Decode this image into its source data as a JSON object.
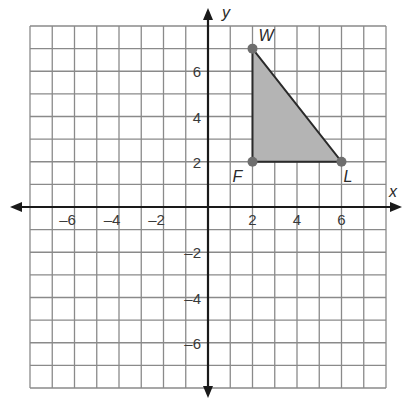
{
  "chart_data": {
    "type": "scatter",
    "title": "",
    "xlabel": "x",
    "ylabel": "y",
    "xlim": [
      -8,
      8
    ],
    "ylim": [
      -8,
      8
    ],
    "grid": true,
    "x_ticks": [
      -6,
      -4,
      -2,
      2,
      4,
      6
    ],
    "y_ticks": [
      6,
      4,
      2,
      -2,
      -4,
      -6
    ],
    "x_tick_labels": [
      "–6",
      "–4",
      "–2",
      "2",
      "4",
      "6"
    ],
    "y_tick_labels": [
      "6",
      "4",
      "2",
      "–2",
      "–4",
      "–6"
    ],
    "polygon": {
      "name": "Triangle FWL",
      "fill": "#b4b4b4",
      "vertices": [
        {
          "label": "W",
          "x": 2,
          "y": 7
        },
        {
          "label": "F",
          "x": 2,
          "y": 2
        },
        {
          "label": "L",
          "x": 6,
          "y": 2
        }
      ]
    }
  },
  "axes": {
    "x_label": "x",
    "y_label": "y"
  },
  "points": {
    "W": "W",
    "F": "F",
    "L": "L"
  }
}
